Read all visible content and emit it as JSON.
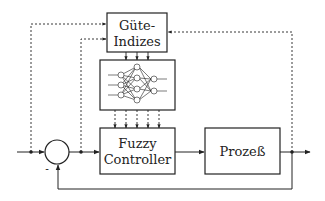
{
  "diagram": {
    "type": "block-diagram",
    "blocks": {
      "quality": {
        "line1": "Güte-",
        "line2": "Indizes"
      },
      "neural_net": {
        "label": ""
      },
      "controller": {
        "line1": "Fuzzy",
        "line2": "Controller"
      },
      "process": {
        "label": "Prozeß"
      }
    },
    "summing_junction": {
      "minus_sign": "-"
    },
    "colors": {
      "stroke": "#222222",
      "background": "#ffffff"
    }
  }
}
